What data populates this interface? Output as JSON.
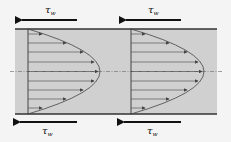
{
  "diagram": {
    "shear_label": "τ",
    "shear_subscript": "w",
    "colors": {
      "background": "#f4f4f4",
      "fluid": "#cfd0cf",
      "wall": "#333333",
      "arrow": "#111111",
      "profile": "#444444"
    },
    "profiles": [
      {
        "name": "profile-1",
        "x_start": 28,
        "x_vertex": 100
      },
      {
        "name": "profile-2",
        "x_start": 131,
        "x_vertex": 204
      }
    ],
    "top_labels": [
      {
        "text": "τ",
        "sub": "w",
        "x": 60,
        "y": 14
      },
      {
        "text": "τ",
        "sub": "w",
        "x": 150,
        "y": 14
      }
    ],
    "bottom_labels": [
      {
        "text": "τ",
        "sub": "w",
        "x": 42,
        "y": 134
      },
      {
        "text": "τ",
        "sub": "w",
        "x": 147,
        "y": 134
      }
    ]
  }
}
